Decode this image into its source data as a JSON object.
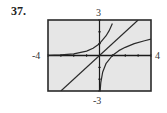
{
  "problem_number": "37.",
  "window_labels": {
    "top": "3",
    "bottom": "-3",
    "left": "-4",
    "right": "4"
  },
  "colors": {
    "frame": "#2a2a2a",
    "plot_background": "#e6e6e6",
    "curve": "#2a2a2a",
    "axis": "#1a1a1a"
  },
  "chart_data": {
    "type": "line",
    "title": "",
    "xlabel": "",
    "ylabel": "",
    "xlim": [
      -4,
      4
    ],
    "ylim": [
      -3,
      3
    ],
    "grid": false,
    "axis_ticks": {
      "x_step": 1,
      "y_step": 1
    },
    "tick_labels": {
      "xmin": "-4",
      "xmax": "4",
      "ymin": "-3",
      "ymax": "3"
    },
    "legend": null,
    "note": "Three unlabeled curves; no formulas are shown in the image. Points are approximate shape readings.",
    "series": [
      {
        "name": "curve-a",
        "description": "increasing curve, flat near the x-axis on the left, steep on the right (exponential-like)",
        "x": [
          -4,
          -3,
          -2,
          -1,
          -0.5,
          0,
          0.5,
          0.75,
          1.0
        ],
        "y": [
          0.02,
          0.05,
          0.14,
          0.37,
          0.61,
          1.0,
          1.65,
          2.1,
          2.7
        ]
      },
      {
        "name": "curve-b",
        "description": "straight line through the origin",
        "x": [
          -3,
          3
        ],
        "y": [
          -3,
          3
        ]
      },
      {
        "name": "curve-c",
        "description": "increasing curve, steep near the y-axis, flattening to the right (logarithm-like)",
        "x": [
          0.05,
          0.1,
          0.25,
          0.5,
          1.0,
          1.5,
          2.0,
          2.7,
          3.5,
          4.0
        ],
        "y": [
          -3.0,
          -2.3,
          -1.39,
          -0.69,
          0.0,
          0.41,
          0.69,
          1.0,
          1.25,
          1.39
        ]
      }
    ]
  }
}
